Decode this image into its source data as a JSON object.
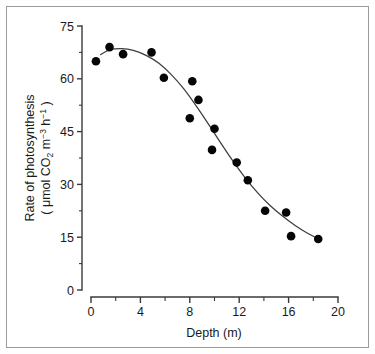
{
  "figure": {
    "background_color": "#ffffff",
    "border_color": "#9a9a9a",
    "point_color": "#050505",
    "curve_color": "#3d3d3d"
  },
  "axes": {
    "x": {
      "title": "Depth (m)",
      "title_parts": {
        "name": "Depth",
        "unit": "(m)"
      },
      "ticks": [
        "0",
        "4",
        "8",
        "12",
        "16",
        "20"
      ],
      "tick_values": [
        0,
        4,
        8,
        12,
        16,
        20
      ],
      "minor_tick_values": [
        2,
        6,
        10,
        14,
        18
      ],
      "range": [
        0,
        20
      ]
    },
    "y": {
      "title_line1": "Rate of photosynthesis",
      "title_line2_prefix": "( μmol CO",
      "title_line2_sub": "2",
      "title_line2_mid": " m",
      "title_line2_sup1": "−3",
      "title_line2_mid2": " h",
      "title_line2_sup2": "−1",
      "title_line2_suffix": " )",
      "title_full": "Rate of photosynthesis ( μmol CO2 m-3 h-1 )",
      "ticks": [
        "0",
        "15",
        "30",
        "45",
        "60",
        "75"
      ],
      "tick_values": [
        0,
        15,
        30,
        45,
        60,
        75
      ],
      "minor_tick_values": [
        7.5,
        22.5,
        37.5,
        52.5,
        67.5
      ],
      "range": [
        0,
        75
      ]
    }
  },
  "chart_data": {
    "type": "scatter",
    "title": "",
    "xlabel": "Depth (m)",
    "ylabel": "Rate of photosynthesis ( μmol CO2 m-3 h-1 )",
    "xlim": [
      0,
      20
    ],
    "ylim": [
      0,
      75
    ],
    "grid": false,
    "legend": "none",
    "x": [
      0.4,
      1.5,
      2.6,
      4.9,
      5.9,
      8.0,
      8.2,
      8.7,
      9.8,
      10.0,
      11.8,
      12.7,
      14.1,
      15.8,
      16.2,
      18.4
    ],
    "y": [
      65.0,
      69.0,
      67.0,
      67.5,
      60.3,
      48.8,
      59.3,
      54.0,
      39.8,
      45.8,
      36.2,
      31.2,
      22.5,
      22.0,
      15.3,
      14.5
    ],
    "points": [
      {
        "x": 0.4,
        "y": 65.0
      },
      {
        "x": 1.5,
        "y": 69.0
      },
      {
        "x": 2.6,
        "y": 67.0
      },
      {
        "x": 4.9,
        "y": 67.5
      },
      {
        "x": 5.9,
        "y": 60.3
      },
      {
        "x": 8.0,
        "y": 48.8
      },
      {
        "x": 8.2,
        "y": 59.3
      },
      {
        "x": 8.7,
        "y": 54.0
      },
      {
        "x": 9.8,
        "y": 39.8
      },
      {
        "x": 10.0,
        "y": 45.8
      },
      {
        "x": 11.8,
        "y": 36.2
      },
      {
        "x": 12.7,
        "y": 31.2
      },
      {
        "x": 14.1,
        "y": 22.5
      },
      {
        "x": 15.8,
        "y": 22.0
      },
      {
        "x": 16.2,
        "y": 15.3
      },
      {
        "x": 18.4,
        "y": 14.5
      }
    ],
    "fit_curve": {
      "description": "sigmoid-like smoothed trend line",
      "x": [
        0.75,
        1.5,
        2.5,
        3.5,
        4.5,
        5.5,
        6.5,
        7.5,
        8.5,
        9.5,
        10.5,
        11.5,
        12.5,
        13.5,
        14.5,
        15.5,
        16.5,
        17.5,
        18.6
      ],
      "y": [
        66.8,
        68.2,
        68.6,
        68.0,
        66.6,
        64.4,
        61.2,
        57.2,
        52.4,
        47.2,
        41.8,
        36.6,
        31.8,
        27.6,
        24.0,
        21.0,
        18.4,
        16.2,
        14.2
      ]
    }
  }
}
